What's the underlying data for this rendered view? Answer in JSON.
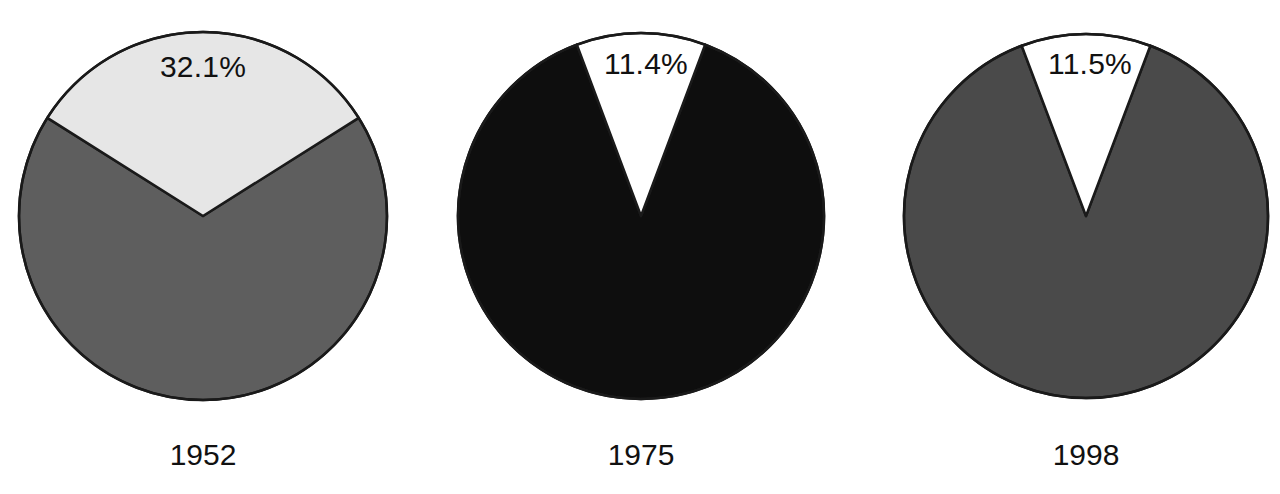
{
  "figure": {
    "background_color": "#ffffff",
    "panel_count": 3
  },
  "chart_data": [
    {
      "type": "pie",
      "title": "",
      "year_label": "1952",
      "labels": [
        "Highlighted share",
        "Remainder"
      ],
      "values": [
        32.1,
        67.9
      ],
      "value_labels": [
        "32.1%",
        ""
      ],
      "colors": [
        "#e6e6e6",
        "#5e5e5e"
      ],
      "stroke_color": "#1a1a1a",
      "start_angle_deg": -57.8,
      "legend": "none",
      "grid": false,
      "geometry": {
        "cx": 203,
        "cy": 216,
        "r": 184
      }
    },
    {
      "type": "pie",
      "title": "",
      "year_label": "1975",
      "labels": [
        "Highlighted share",
        "Remainder"
      ],
      "values": [
        11.4,
        88.6
      ],
      "value_labels": [
        "11.4%",
        ""
      ],
      "colors": [
        "#ffffff",
        "#0e0e0e"
      ],
      "stroke_color": "#1a1a1a",
      "start_angle_deg": -20.5,
      "legend": "none",
      "grid": false,
      "geometry": {
        "cx": 641,
        "cy": 216,
        "r": 183
      }
    },
    {
      "type": "pie",
      "title": "",
      "year_label": "1998",
      "labels": [
        "Highlighted share",
        "Remainder"
      ],
      "values": [
        11.5,
        88.5
      ],
      "value_labels": [
        "11.5%",
        ""
      ],
      "colors": [
        "#ffffff",
        "#4a4a4a"
      ],
      "stroke_color": "#1a1a1a",
      "start_angle_deg": -20.7,
      "legend": "none",
      "grid": false,
      "geometry": {
        "cx": 1086,
        "cy": 216,
        "r": 182
      }
    }
  ],
  "panels": [
    {
      "year": "1952",
      "percent": "32.1%",
      "percent_x": 203,
      "percent_y": 80,
      "caption_x": 73,
      "caption_y": 440
    },
    {
      "year": "1975",
      "percent": "11.4%",
      "percent_x": 646,
      "percent_y": 77,
      "caption_x": 511,
      "caption_y": 440
    },
    {
      "year": "1998",
      "percent": "11.5%",
      "percent_x": 1090,
      "percent_y": 77,
      "caption_x": 956,
      "caption_y": 440
    }
  ]
}
